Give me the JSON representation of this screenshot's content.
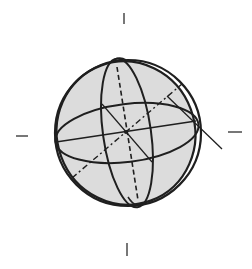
{
  "diagram": {
    "title": "",
    "colors": {
      "background": "#ffffff",
      "stroke": "#1f1f1f",
      "fill": "#dcdcdc",
      "tick": "#555555"
    },
    "ticks": [
      "top",
      "bottom",
      "left",
      "right"
    ]
  }
}
